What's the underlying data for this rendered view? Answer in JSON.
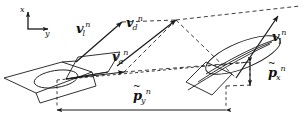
{
  "figure": {
    "type": "vector-diagram",
    "width": 308,
    "height": 128,
    "background": "#ffffff",
    "stroke": "#1a1a1a",
    "axes": {
      "origin": [
        28,
        28
      ],
      "x_label": "x",
      "y_label": "y",
      "x_tip": [
        28,
        10
      ],
      "y_tip": [
        50,
        28
      ]
    },
    "vectors": [
      {
        "name": "v-l-left",
        "base": "v",
        "sub": "l",
        "sup": "n",
        "label_x": 76,
        "label_y": 20,
        "from": [
          76,
          62
        ],
        "to": [
          122,
          22
        ]
      },
      {
        "name": "v-d",
        "base": "v",
        "sub": "d",
        "sup": "n",
        "label_x": 126,
        "label_y": 14,
        "from": [
          117,
          66
        ],
        "to": [
          176,
          20
        ]
      },
      {
        "name": "v-a",
        "base": "v",
        "sub": "a",
        "sup": "n",
        "label_x": 112,
        "label_y": 48,
        "from": [
          66,
          79
        ],
        "to": [
          124,
          72
        ]
      },
      {
        "name": "v-l-right",
        "base": "v",
        "sub": "l",
        "sup": "n",
        "label_x": 272,
        "label_y": 28,
        "from": [
          236,
          78
        ],
        "to": [
          278,
          16
        ]
      }
    ],
    "measures": [
      {
        "name": "p-tilde-x",
        "base": "p",
        "sub": "x",
        "sup": "n",
        "tilde": "~",
        "label_x": 268,
        "label_y": 64,
        "orientation": "vertical",
        "from": [
          250,
          62
        ],
        "to": [
          250,
          85
        ]
      },
      {
        "name": "p-tilde-y",
        "base": "p",
        "sub": "y",
        "sup": "n",
        "tilde": "~",
        "label_x": 133,
        "label_y": 87,
        "orientation": "horizontal",
        "from": [
          226,
          110
        ],
        "to": [
          57,
          110
        ]
      }
    ]
  }
}
